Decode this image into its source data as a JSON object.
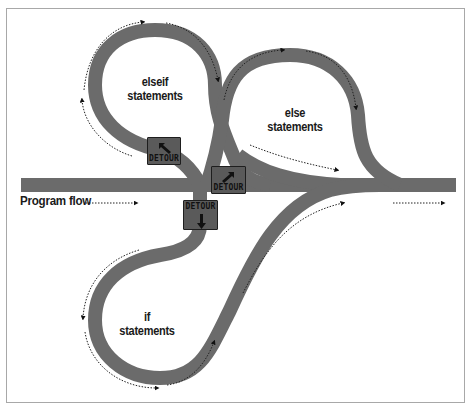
{
  "diagram": {
    "colors": {
      "road": "#6b6b6b",
      "sign_fill": "#5a5a5a",
      "sign_border": "#1e1e1e",
      "text": "#1a1a1a",
      "frame": "#a8a8a8",
      "background": "#ffffff"
    },
    "labels": {
      "program_flow": "Program flow",
      "elseif_line1": "elseif",
      "elseif_line2": "statements",
      "else_line1": "else",
      "else_line2": "statements",
      "if_line1": "if",
      "if_line2": "statements"
    },
    "signs": [
      {
        "id": "detour-elseif",
        "text": "DETOUR",
        "arrow": "arrow-up-left-icon"
      },
      {
        "id": "detour-else",
        "text": "DETOUR",
        "arrow": "arrow-up-right-icon"
      },
      {
        "id": "detour-if",
        "text": "DETOUR",
        "arrow": "arrow-down-icon"
      }
    ],
    "flow_arrows": [
      "program-flow-arrow",
      "elseif-loop-arrows",
      "else-loop-arrows",
      "if-loop-arrows",
      "exit-arrow"
    ]
  }
}
